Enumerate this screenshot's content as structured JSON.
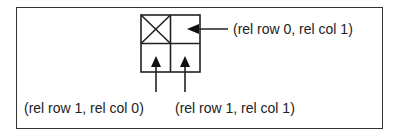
{
  "diagram": {
    "grid": {
      "rows": 2,
      "cols": 2,
      "marked_cell": {
        "row": 0,
        "col": 0,
        "mark": "X"
      }
    },
    "labels": {
      "row0_col1": "(rel row 0, rel col 1)",
      "row1_col0": "(rel row 1, rel col 0)",
      "row1_col1": "(rel row 1, rel col 1)"
    },
    "colors": {
      "stroke": "#222222",
      "frame": "#333333",
      "background": "#ffffff"
    }
  }
}
